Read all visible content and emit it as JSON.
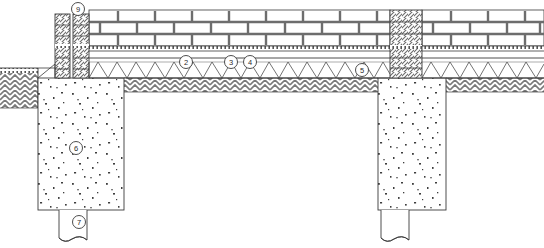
{
  "drawing": {
    "title": "Foundation and wall construction section detail",
    "type": "architectural-section",
    "canvas": {
      "width": 544,
      "height": 248
    },
    "background_color": "#ffffff",
    "line_color": "#3a3a3a",
    "hatch_color": "#6d6d6d",
    "aggregate_color": "#444444"
  },
  "callouts": [
    {
      "id": "callout-9",
      "label": "9",
      "cx": 78,
      "cy": 9,
      "r": 6.5,
      "leader_to": {
        "x": 78,
        "y": 16
      }
    },
    {
      "id": "callout-2",
      "label": "2",
      "cx": 186,
      "cy": 62,
      "r": 6.5,
      "leader_to": {
        "x": 186,
        "y": 62
      }
    },
    {
      "id": "callout-3",
      "label": "3",
      "cx": 231,
      "cy": 62,
      "r": 6.5,
      "leader_to": {
        "x": 231,
        "y": 62
      }
    },
    {
      "id": "callout-4",
      "label": "4",
      "cx": 250,
      "cy": 62,
      "r": 6.5,
      "leader_to": {
        "x": 250,
        "y": 62
      }
    },
    {
      "id": "callout-5",
      "label": "5",
      "cx": 362,
      "cy": 70,
      "r": 6.5,
      "leader_to": {
        "x": 362,
        "y": 70
      }
    },
    {
      "id": "callout-6",
      "label": "6",
      "cx": 76,
      "cy": 148,
      "r": 6.5,
      "leader_to": {
        "x": 76,
        "y": 148
      }
    },
    {
      "id": "callout-7",
      "label": "7",
      "cx": 79,
      "cy": 222,
      "r": 6.5,
      "leader_to": {
        "x": 79,
        "y": 222
      }
    }
  ],
  "layers": {
    "brick_wall": {
      "name": "brick-masonry-wall",
      "top": 10,
      "bottom": 45,
      "courses": 3
    },
    "screed_band": {
      "name": "mortar-screed-band",
      "top": 45,
      "bottom": 50
    },
    "slab": {
      "name": "floor-slab",
      "top": 57,
      "bottom": 60
    },
    "zigzag_fill": {
      "name": "zigzag-truss-fill",
      "top": 60,
      "bottom": 78,
      "pitch": 19
    },
    "earth_hatch": {
      "name": "earth-fill-hatch",
      "top": 78,
      "bottom": 92
    },
    "left_column": {
      "name": "hatched-column-left",
      "x": 55,
      "width": 15,
      "top": 12,
      "bottom": 78
    },
    "left_column_b": {
      "name": "hatched-column-left-inner",
      "x": 73,
      "width": 16,
      "top": 12,
      "bottom": 78
    },
    "right_column": {
      "name": "hatched-column-right",
      "x": 390,
      "width": 32,
      "top": 10,
      "bottom": 78
    },
    "left_footing": {
      "name": "concrete-footing-left",
      "x": 38,
      "y": 78,
      "width": 86,
      "height": 132
    },
    "right_footing": {
      "name": "concrete-footing-right",
      "x": 378,
      "y": 78,
      "width": 68,
      "height": 132
    },
    "left_pile": {
      "name": "pile-shaft-left",
      "x": 59,
      "y": 210,
      "width": 41,
      "height": 34
    },
    "right_pile": {
      "name": "pile-shaft-right",
      "x": 381,
      "y": 210,
      "width": 41,
      "height": 34
    }
  }
}
